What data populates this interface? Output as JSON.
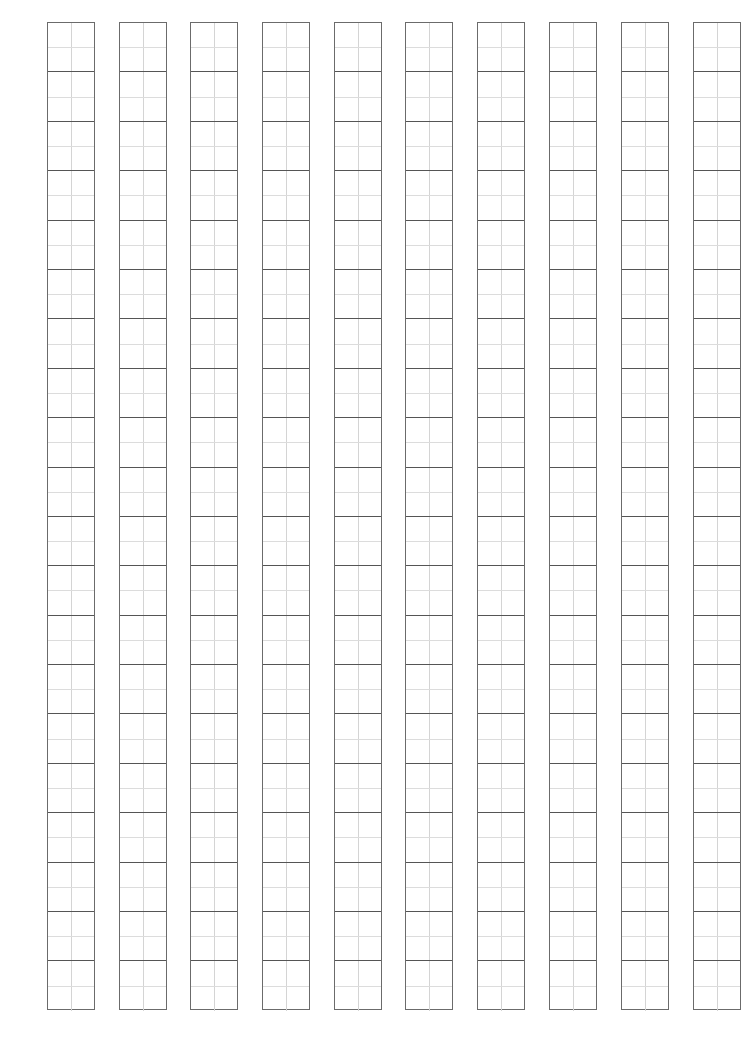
{
  "sheet": {
    "type": "tianzige-practice-grid",
    "columns": 10,
    "rows_per_column": 20,
    "column_lefts": [
      47,
      119,
      190,
      262,
      334,
      405,
      477,
      549,
      621,
      693
    ],
    "colors": {
      "border": "#6b6b6b",
      "divider": "#555555",
      "guide": "#d4d4d4",
      "background": "#ffffff"
    }
  }
}
